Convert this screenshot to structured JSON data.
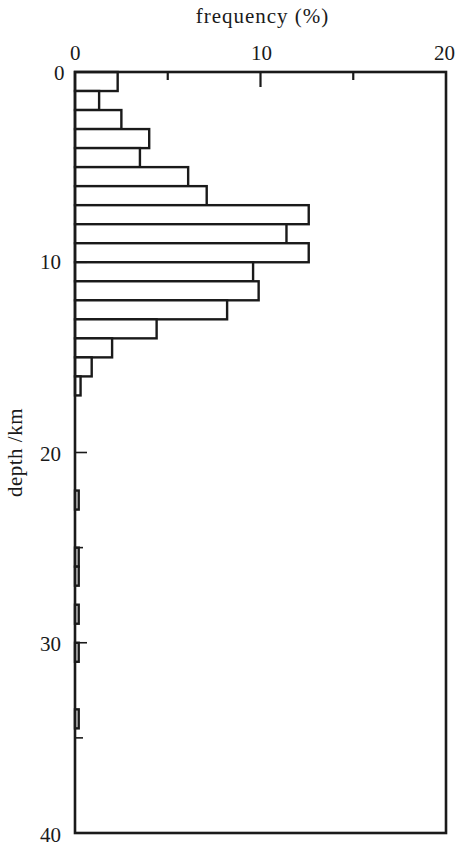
{
  "chart_data": {
    "type": "bar",
    "orientation": "horizontal",
    "title": "",
    "xlabel": "frequency (%)",
    "ylabel": "depth /km",
    "xlim": [
      0,
      20
    ],
    "ylim": [
      0,
      40
    ],
    "y_inverted": true,
    "x_ticks": [
      0,
      10,
      20
    ],
    "x_minor_ticks": [
      5,
      15
    ],
    "y_ticks": [
      0,
      10,
      20,
      30,
      40
    ],
    "y_minor_ticks": [
      25,
      35
    ],
    "grid": false,
    "bin_width_km": 1,
    "categories": [
      "0-1",
      "1-2",
      "2-3",
      "3-4",
      "4-5",
      "5-6",
      "6-7",
      "7-8",
      "8-9",
      "9-10",
      "10-11",
      "11-12",
      "12-13",
      "13-14",
      "14-15",
      "15-16",
      "16-17",
      "22-23",
      "25-26",
      "26-27",
      "28-29",
      "30-31",
      "33.5-34.5"
    ],
    "bins": [
      {
        "top": 0,
        "bottom": 1,
        "value": 2.3
      },
      {
        "top": 1,
        "bottom": 2,
        "value": 1.3
      },
      {
        "top": 2,
        "bottom": 3,
        "value": 2.5
      },
      {
        "top": 3,
        "bottom": 4,
        "value": 4.0
      },
      {
        "top": 4,
        "bottom": 5,
        "value": 3.5
      },
      {
        "top": 5,
        "bottom": 6,
        "value": 6.1
      },
      {
        "top": 6,
        "bottom": 7,
        "value": 7.1
      },
      {
        "top": 7,
        "bottom": 8,
        "value": 12.6
      },
      {
        "top": 8,
        "bottom": 9,
        "value": 11.4
      },
      {
        "top": 9,
        "bottom": 10,
        "value": 12.6
      },
      {
        "top": 10,
        "bottom": 11,
        "value": 9.6
      },
      {
        "top": 11,
        "bottom": 12,
        "value": 9.9
      },
      {
        "top": 12,
        "bottom": 13,
        "value": 8.2
      },
      {
        "top": 13,
        "bottom": 14,
        "value": 4.4
      },
      {
        "top": 14,
        "bottom": 15,
        "value": 2.0
      },
      {
        "top": 15,
        "bottom": 16,
        "value": 0.9
      },
      {
        "top": 16,
        "bottom": 17,
        "value": 0.3
      },
      {
        "top": 22,
        "bottom": 23,
        "value": 0.2
      },
      {
        "top": 25,
        "bottom": 26,
        "value": 0.2
      },
      {
        "top": 26,
        "bottom": 27,
        "value": 0.2
      },
      {
        "top": 28,
        "bottom": 29,
        "value": 0.2
      },
      {
        "top": 30,
        "bottom": 31,
        "value": 0.2
      },
      {
        "top": 33.5,
        "bottom": 34.5,
        "value": 0.2
      }
    ],
    "values": [
      2.3,
      1.3,
      2.5,
      4.0,
      3.5,
      6.1,
      7.1,
      12.6,
      11.4,
      12.6,
      9.6,
      9.9,
      8.2,
      4.4,
      2.0,
      0.9,
      0.3,
      0.2,
      0.2,
      0.2,
      0.2,
      0.2,
      0.2
    ]
  },
  "labels": {
    "x_axis_title": "frequency (%)",
    "y_axis_title": "depth /km",
    "x_tick_0": "0",
    "x_tick_10": "10",
    "x_tick_20": "20",
    "y_tick_0": "0",
    "y_tick_10": "10",
    "y_tick_20": "20",
    "y_tick_30": "30",
    "y_tick_40": "40"
  }
}
